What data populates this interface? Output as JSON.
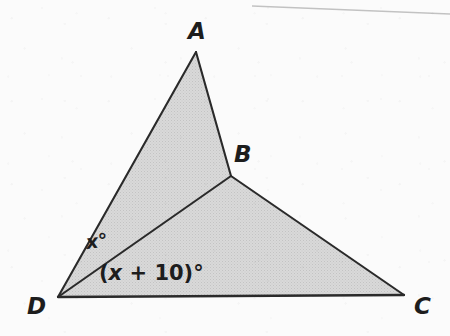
{
  "figure": {
    "canvas": {
      "width": 450,
      "height": 336
    },
    "background_color": "#fbfbfb",
    "fill_color": "#d5d5d5",
    "stroke_color": "#2a2a2a",
    "vertices": [
      {
        "name": "A",
        "label": "A",
        "x": 196,
        "y": 52,
        "label_x": 188,
        "label_y": 20
      },
      {
        "name": "B",
        "label": "B",
        "x": 231,
        "y": 176,
        "label_x": 234,
        "label_y": 143
      },
      {
        "name": "C",
        "label": "C",
        "x": 404,
        "y": 295,
        "label_x": 414,
        "label_y": 295
      },
      {
        "name": "D",
        "label": "D",
        "x": 58,
        "y": 297,
        "label_x": 27,
        "label_y": 295
      }
    ],
    "edges": [
      {
        "name": "edge-AD",
        "from": "A",
        "to": "D"
      },
      {
        "name": "edge-AB",
        "from": "A",
        "to": "B"
      },
      {
        "name": "edge-DB",
        "from": "D",
        "to": "B"
      },
      {
        "name": "edge-BC",
        "from": "B",
        "to": "C"
      },
      {
        "name": "edge-DC",
        "from": "D",
        "to": "C"
      }
    ],
    "regions": [
      {
        "name": "region-ABD",
        "vertices": [
          "A",
          "B",
          "D"
        ],
        "shaded": true
      },
      {
        "name": "region-DBC",
        "vertices": [
          "D",
          "B",
          "C"
        ],
        "shaded": true
      }
    ],
    "angle_labels": [
      {
        "name": "angle-ADB",
        "text": "x°",
        "variable": "x",
        "suffix": "°",
        "at_vertex": "D",
        "x": 86,
        "y": 233
      },
      {
        "name": "angle-BDC",
        "text": "(x + 10)°",
        "prefix": "(",
        "variable": "x",
        "operator": " + ",
        "constant": "10",
        "suffix": ")°",
        "at_vertex": "D",
        "x": 99,
        "y": 263
      }
    ],
    "artifacts": [
      {
        "name": "scan-edge-line",
        "type": "line",
        "x1": 252,
        "y1": 6,
        "x2": 450,
        "y2": 14,
        "color": "#b9b9b9"
      }
    ]
  }
}
